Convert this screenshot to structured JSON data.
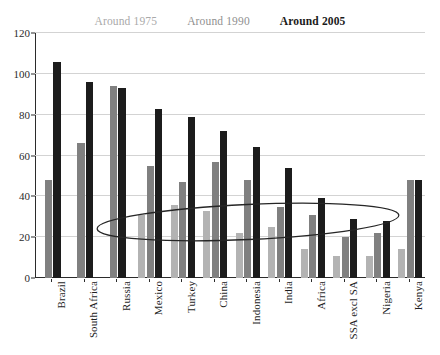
{
  "chart_data": {
    "type": "bar",
    "title": "",
    "xlabel": "",
    "ylabel": "",
    "ylim": [
      0,
      120
    ],
    "yticks": [
      0,
      20,
      40,
      60,
      80,
      100,
      120
    ],
    "grid": true,
    "legend_position": "top-center",
    "categories": [
      "Brazil",
      "South Africa",
      "Russia",
      "Mexico",
      "Turkey",
      "China",
      "Indonesia",
      "India",
      "Africa",
      "SSA excl SA",
      "Nigeria",
      "Kenya"
    ],
    "series": [
      {
        "name": "Around 1975",
        "color": "#b3b3b3",
        "values": [
          null,
          null,
          null,
          31,
          36,
          33,
          22,
          25,
          14,
          11,
          11,
          14
        ]
      },
      {
        "name": "Around 1990",
        "color": "#808080",
        "values": [
          48,
          66,
          94,
          55,
          47,
          57,
          48,
          35,
          31,
          20,
          22,
          48
        ]
      },
      {
        "name": "Around 2005",
        "color": "#1c1c1c",
        "values": [
          106,
          96,
          93,
          83,
          79,
          72,
          64,
          54,
          39,
          29,
          28,
          48
        ]
      }
    ],
    "annotations": [
      {
        "type": "ellipse",
        "name": "highlight-ellipse",
        "center_x_category_range": [
          "Russia",
          "Kenya"
        ],
        "center_value": 28,
        "value_span": [
          20,
          37
        ]
      }
    ]
  },
  "legend": {
    "items": [
      {
        "label": "Around 1975",
        "color": "#a9a9a9",
        "bold": false
      },
      {
        "label": "Around 1990",
        "color": "#8f8f8f",
        "bold": false
      },
      {
        "label": "Around 2005",
        "color": "#1a1a1a",
        "bold": true
      }
    ]
  },
  "axis": {
    "y_tick_labels": [
      "120",
      "100",
      "80",
      "60",
      "40",
      "20",
      "0"
    ]
  }
}
